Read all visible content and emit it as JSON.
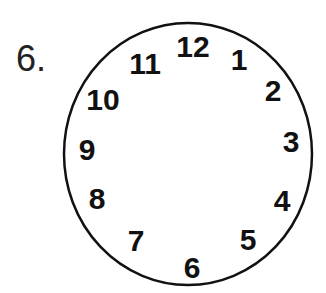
{
  "question_number": "6.",
  "clock": {
    "face": {
      "cx": 188,
      "cy": 154,
      "rx": 124,
      "ry": 131,
      "stroke": "#111111",
      "stroke_width": 2.5
    },
    "numerals": [
      {
        "label": "12",
        "x": 193,
        "y": 57
      },
      {
        "label": "1",
        "x": 239,
        "y": 70
      },
      {
        "label": "2",
        "x": 273,
        "y": 101
      },
      {
        "label": "3",
        "x": 291,
        "y": 152
      },
      {
        "label": "4",
        "x": 282,
        "y": 211
      },
      {
        "label": "5",
        "x": 248,
        "y": 250
      },
      {
        "label": "6",
        "x": 192,
        "y": 278
      },
      {
        "label": "7",
        "x": 136,
        "y": 251
      },
      {
        "label": "8",
        "x": 97,
        "y": 209
      },
      {
        "label": "9",
        "x": 87,
        "y": 160
      },
      {
        "label": "10",
        "x": 103,
        "y": 110
      },
      {
        "label": "11",
        "x": 145,
        "y": 74
      }
    ]
  }
}
